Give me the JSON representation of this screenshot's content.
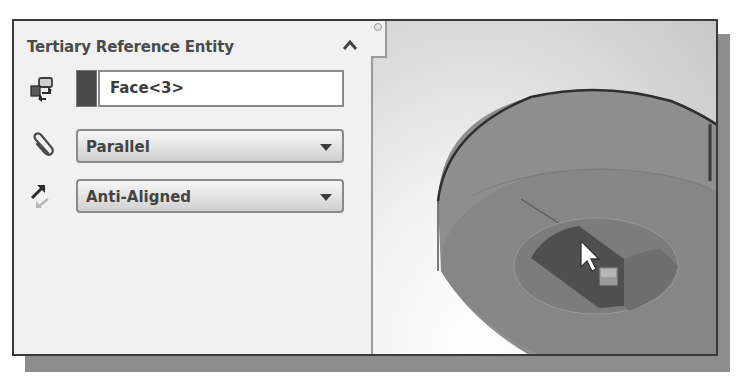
{
  "panel": {
    "section_title": "Tertiary Reference Entity",
    "collapse_icon": "chevron-up-icon",
    "selection": {
      "icon": "reference-entity-icon",
      "value": "Face<3>",
      "swatch_color": "#4a4a4a"
    },
    "constraint": {
      "icon": "paperclip-icon",
      "selected": "Parallel"
    },
    "alignment": {
      "icon": "alignment-arrow-icon",
      "selected": "Anti-Aligned"
    }
  },
  "viewport": {
    "model": "cylindrical part with counterbore hole",
    "selected_face": "Face<3>",
    "cursor_icon": "face-select-cursor-icon"
  },
  "colors": {
    "frame_border": "#3a3a3a",
    "shadow": "#8d8d8d",
    "panel_bg": "#f1f1f1",
    "model_face": "#8c8c8c"
  }
}
